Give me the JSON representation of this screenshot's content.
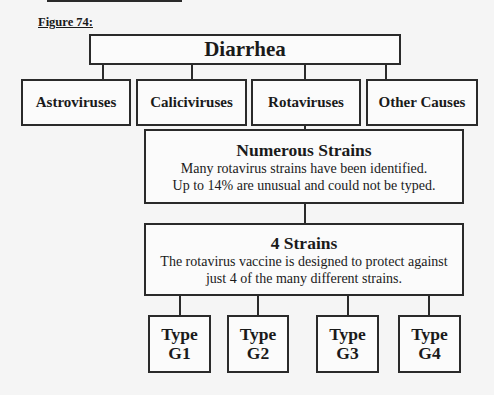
{
  "figure_label": "Figure 74:",
  "root": {
    "label": "Diarrhea"
  },
  "causes": [
    {
      "label": "Astroviruses"
    },
    {
      "label": "Caliciviruses"
    },
    {
      "label": "Rotaviruses"
    },
    {
      "label": "Other Causes"
    }
  ],
  "numerous": {
    "title": "Numerous Strains",
    "line1": "Many rotavirus strains have been identified.",
    "line2": "Up to 14% are unusual and could not be typed."
  },
  "four": {
    "title": "4 Strains",
    "line1": "The rotavirus vaccine is designed to protect against",
    "line2": "just 4 of the many different strains."
  },
  "types": [
    {
      "line1": "Type",
      "line2": "G1"
    },
    {
      "line1": "Type",
      "line2": "G2"
    },
    {
      "line1": "Type",
      "line2": "G3"
    },
    {
      "line1": "Type",
      "line2": "G4"
    }
  ]
}
